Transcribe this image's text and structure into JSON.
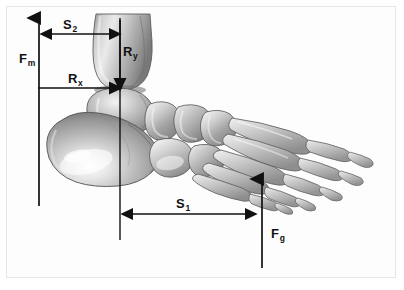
{
  "figure": {
    "render_style": "grayscale 3D anatomical render",
    "width": 404,
    "height": 290,
    "background_color": "#ffffff",
    "frame_color": "#e6e6e6",
    "panel_color": "#fdfdfd",
    "line_color": "#111111"
  },
  "labels": {
    "fm": {
      "base": "F",
      "sub": "m",
      "name": "muscle-force-label",
      "meaning": "muscle force (Achilles tendon)"
    },
    "ry": {
      "base": "R",
      "sub": "y",
      "name": "reaction-force-y-label",
      "meaning": "vertical joint reaction force"
    },
    "rx": {
      "base": "R",
      "sub": "x",
      "name": "reaction-force-x-label",
      "meaning": "horizontal joint reaction force"
    },
    "fg": {
      "base": "F",
      "sub": "g",
      "name": "ground-reaction-force-label",
      "meaning": "ground reaction force"
    },
    "s1": {
      "base": "S",
      "sub": "1",
      "name": "distance-s1-label",
      "meaning": "moment arm from joint axis to ground force"
    },
    "s2": {
      "base": "S",
      "sub": "2",
      "name": "distance-s2-label",
      "meaning": "moment arm from joint axis to muscle force"
    }
  },
  "vectors": [
    {
      "id": "fm",
      "name": "muscle-force-arrow",
      "orientation": "vertical",
      "direction": "up",
      "x": 39,
      "y_start": 206,
      "y_end": 18
    },
    {
      "id": "ry",
      "name": "reaction-force-y-arrow",
      "orientation": "vertical",
      "direction": "down",
      "x": 120,
      "y_start": 20,
      "y_end": 90
    },
    {
      "id": "rx",
      "name": "reaction-force-x-arrow",
      "orientation": "horizontal",
      "direction": "right",
      "y": 88,
      "x_start": 38,
      "x_end": 121
    },
    {
      "id": "fg",
      "name": "ground-reaction-force-arrow",
      "orientation": "vertical",
      "direction": "up",
      "x": 262,
      "y_start": 268,
      "y_end": 179
    }
  ],
  "dimensions": [
    {
      "id": "s1",
      "name": "distance-s1-arrow",
      "orientation": "horizontal",
      "direction": "both",
      "y": 214,
      "x_start": 122,
      "x_end": 256
    },
    {
      "id": "s2",
      "name": "distance-s2-arrow",
      "orientation": "horizontal",
      "direction": "both",
      "y": 34,
      "x_start": 41,
      "x_end": 120
    }
  ],
  "reference_lines": [
    {
      "id": "joint-axis",
      "name": "joint-axis-vertical-line",
      "x": 120,
      "y_start": 18,
      "y_end": 240
    }
  ],
  "anatomy": {
    "bones": [
      "tibia",
      "talus",
      "calcaneus",
      "navicular",
      "cuboid",
      "cuneiforms",
      "metatarsals",
      "proximal phalanges",
      "middle phalanges",
      "distal phalanges"
    ]
  }
}
